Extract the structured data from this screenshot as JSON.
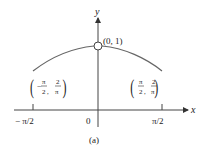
{
  "figure": {
    "caption": "(a)",
    "axes": {
      "x_label": "x",
      "y_label": "y",
      "x_ticks": [
        {
          "label": "− π/2",
          "value": "-pi/2"
        },
        {
          "label": "0",
          "value": "0"
        },
        {
          "label": "π/2",
          "value": "pi/2"
        }
      ]
    },
    "curve": {
      "description": "f(x) = sin(x)/x on [-π/2, π/2] with hole at x=0",
      "color": "#555555"
    },
    "points": {
      "top": {
        "label": "(0, 1)",
        "style": "open-circle"
      },
      "left": {
        "num_x": "π",
        "den_x": "2",
        "sign_x": "−",
        "num_y": "2",
        "den_y": "π"
      },
      "right": {
        "num_x": "π",
        "den_x": "2",
        "sign_x": "",
        "num_y": "2",
        "den_y": "π"
      }
    }
  }
}
